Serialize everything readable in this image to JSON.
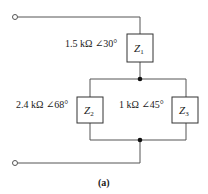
{
  "diagram": {
    "caption": "(a)",
    "wire_color": "#555555",
    "terminals": [
      {
        "name": "terminal-top",
        "x": 15,
        "y": 17
      },
      {
        "name": "terminal-bottom",
        "x": 15,
        "y": 163
      }
    ],
    "nodes": [
      {
        "name": "node-top",
        "x": 140,
        "y": 79
      },
      {
        "name": "node-bottom",
        "x": 140,
        "y": 140
      }
    ],
    "impedances": [
      {
        "id": "Z1",
        "symbol": "Z",
        "subscript": "1",
        "value": "1.5 kΩ ∠30°"
      },
      {
        "id": "Z2",
        "symbol": "Z",
        "subscript": "2",
        "value": "2.4 kΩ ∠68°"
      },
      {
        "id": "Z3",
        "symbol": "Z",
        "subscript": "3",
        "value": "1 kΩ ∠45°"
      }
    ]
  }
}
